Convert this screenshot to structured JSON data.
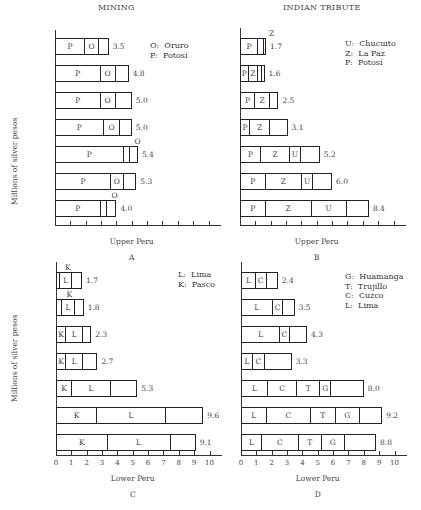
{
  "section_titles": {
    "left": "MINING",
    "right": "INDIAN TRIBUTE"
  },
  "ylabel": "Millions of silver pesos",
  "chart_data": [
    {
      "type": "bar",
      "orientation": "horizontal-stacked",
      "panel": "A",
      "title": "MINING",
      "xlabel": "Upper Peru",
      "ylabel": "Millions of silver pesos",
      "xlim": [
        0,
        10
      ],
      "categories": [
        "1749",
        "'59",
        "'69",
        "'79",
        "'89",
        "'99",
        "1800-09"
      ],
      "legend": [
        {
          "key": "O",
          "name": "Oruro"
        },
        {
          "key": "P",
          "name": "Potosí"
        }
      ],
      "series": [
        {
          "name": "P",
          "values": [
            1.9,
            2.9,
            2.9,
            3.1,
            4.4,
            3.6,
            2.9
          ]
        },
        {
          "name": "O",
          "values": [
            0.9,
            1.0,
            1.0,
            1.1,
            0.4,
            0.8,
            0.4
          ]
        },
        {
          "name": "Other",
          "values": [
            0.7,
            0.9,
            1.1,
            0.8,
            0.6,
            0.9,
            0.7
          ]
        }
      ],
      "totals": [
        3.5,
        4.8,
        5.0,
        5.0,
        5.4,
        5.3,
        4.0
      ]
    },
    {
      "type": "bar",
      "orientation": "horizontal-stacked",
      "panel": "B",
      "title": "INDIAN TRIBUTE",
      "xlabel": "Upper Peru",
      "xlim": [
        0,
        10
      ],
      "categories": [
        "1749",
        "'59",
        "'69",
        "'79",
        "'89",
        "'99",
        "1800-09"
      ],
      "legend": [
        {
          "key": "U",
          "name": "Chucuito"
        },
        {
          "key": "Z",
          "name": "La Paz"
        },
        {
          "key": "P",
          "name": "Potosí"
        }
      ],
      "series": [
        {
          "name": "P",
          "values": [
            1.1,
            0.4,
            0.9,
            0.6,
            1.3,
            1.6,
            1.6
          ]
        },
        {
          "name": "Z",
          "values": [
            0.4,
            0.6,
            1.0,
            1.3,
            1.9,
            2.4,
            3.0
          ]
        },
        {
          "name": "U",
          "values": [
            0.1,
            0.3,
            0.0,
            0.0,
            0.7,
            0.7,
            2.3
          ]
        },
        {
          "name": "Other",
          "values": [
            0.1,
            0.3,
            0.6,
            1.2,
            1.3,
            1.3,
            1.5
          ]
        }
      ],
      "totals": [
        1.7,
        1.6,
        2.5,
        3.1,
        5.2,
        6.0,
        8.4
      ]
    },
    {
      "type": "bar",
      "orientation": "horizontal-stacked",
      "panel": "C",
      "xlabel": "Lower Peru",
      "ylabel": "Millions of silver pesos",
      "xlim": [
        0,
        10
      ],
      "xticks": [
        0,
        1,
        2,
        3,
        4,
        5,
        6,
        7,
        8,
        9,
        10
      ],
      "categories": [
        "1749",
        "'59",
        "'69",
        "'79",
        "'89",
        "'99",
        "1800-09"
      ],
      "legend": [
        {
          "key": "L",
          "name": "Lima"
        },
        {
          "key": "K",
          "name": "Pasco"
        }
      ],
      "series": [
        {
          "name": "K",
          "values": [
            0.1,
            0.3,
            0.6,
            0.6,
            1.0,
            2.6,
            3.3
          ]
        },
        {
          "name": "L",
          "values": [
            0.8,
            0.9,
            1.1,
            1.1,
            2.5,
            4.5,
            4.1
          ]
        },
        {
          "name": "Other",
          "values": [
            0.8,
            0.6,
            0.6,
            1.0,
            1.8,
            2.5,
            1.7
          ]
        }
      ],
      "totals": [
        1.7,
        1.8,
        2.3,
        2.7,
        5.3,
        9.6,
        9.1
      ]
    },
    {
      "type": "bar",
      "orientation": "horizontal-stacked",
      "panel": "D",
      "xlabel": "Lower Peru",
      "xlim": [
        0,
        10
      ],
      "xticks": [
        0,
        1,
        2,
        3,
        4,
        5,
        6,
        7,
        8,
        9,
        10
      ],
      "categories": [
        "1749",
        "'59",
        "'69",
        "'79",
        "'89",
        "'99",
        "1800-09"
      ],
      "legend": [
        {
          "key": "G",
          "name": "Huamanga"
        },
        {
          "key": "T",
          "name": "Trujillo"
        },
        {
          "key": "C",
          "name": "Cuzco"
        },
        {
          "key": "L",
          "name": "Lima"
        }
      ],
      "series": [
        {
          "name": "L",
          "values": [
            0.9,
            2.0,
            2.5,
            0.7,
            1.7,
            1.6,
            1.3
          ]
        },
        {
          "name": "C",
          "values": [
            0.7,
            0.7,
            0.6,
            0.8,
            1.9,
            2.9,
            2.4
          ]
        },
        {
          "name": "T",
          "values": [
            0.0,
            0.0,
            0.0,
            0.0,
            1.5,
            1.6,
            1.5
          ]
        },
        {
          "name": "G",
          "values": [
            0.0,
            0.0,
            0.0,
            0.0,
            0.7,
            1.6,
            1.5
          ]
        },
        {
          "name": "Other",
          "values": [
            0.8,
            0.8,
            1.2,
            1.8,
            2.2,
            1.5,
            2.1
          ]
        }
      ],
      "totals": [
        2.4,
        3.5,
        4.3,
        3.3,
        8.0,
        9.2,
        8.8
      ]
    }
  ],
  "panels": {
    "A": {
      "letter": "A",
      "xlabel": "Upper Peru",
      "legend_text": "O:  Oruro\nP:  Potosí",
      "rows": [
        {
          "label": "1749",
          "total": "3.5",
          "segs": [
            {
              "v": 1.9,
              "t": "P"
            },
            {
              "v": 0.9,
              "t": "O"
            },
            {
              "v": 0.7,
              "t": ""
            }
          ]
        },
        {
          "label": "'59",
          "total": "4.8",
          "segs": [
            {
              "v": 2.9,
              "t": "P"
            },
            {
              "v": 1.0,
              "t": "O"
            },
            {
              "v": 0.9,
              "t": ""
            }
          ]
        },
        {
          "label": "'69",
          "total": "5.0",
          "segs": [
            {
              "v": 2.9,
              "t": "P"
            },
            {
              "v": 1.0,
              "t": "O"
            },
            {
              "v": 1.1,
              "t": ""
            }
          ]
        },
        {
          "label": "'79",
          "total": "5.0",
          "segs": [
            {
              "v": 3.1,
              "t": "P"
            },
            {
              "v": 1.1,
              "t": "O"
            },
            {
              "v": 0.8,
              "t": ""
            }
          ]
        },
        {
          "label": "'89",
          "total": "5.4",
          "segs": [
            {
              "v": 4.4,
              "t": "P"
            },
            {
              "v": 0.4,
              "t": ""
            },
            {
              "v": 0.6,
              "t": ""
            }
          ],
          "callout": "O"
        },
        {
          "label": "'99",
          "total": "5.3",
          "segs": [
            {
              "v": 3.6,
              "t": "P"
            },
            {
              "v": 0.8,
              "t": "O"
            },
            {
              "v": 0.9,
              "t": ""
            }
          ]
        },
        {
          "label": "1800–09",
          "total": "4.0",
          "segs": [
            {
              "v": 2.9,
              "t": "P"
            },
            {
              "v": 0.4,
              "t": ""
            },
            {
              "v": 0.7,
              "t": ""
            }
          ],
          "callout": "O"
        }
      ]
    },
    "B": {
      "letter": "B",
      "xlabel": "Upper Peru",
      "legend_text": "U:  Chucuito\nZ:  La Paz\nP:  Potosí",
      "rows": [
        {
          "label": "",
          "total": "1.7",
          "segs": [
            {
              "v": 1.1,
              "t": "P"
            },
            {
              "v": 0.4,
              "t": ""
            },
            {
              "v": 0.1,
              "t": ""
            },
            {
              "v": 0.1,
              "t": ""
            }
          ],
          "callout": "Z"
        },
        {
          "label": "",
          "total": "1.6",
          "segs": [
            {
              "v": 0.5,
              "t": "P"
            },
            {
              "v": 0.6,
              "t": "Z"
            },
            {
              "v": 0.3,
              "t": ""
            },
            {
              "v": 0.2,
              "t": ""
            }
          ]
        },
        {
          "label": "",
          "total": "2.5",
          "segs": [
            {
              "v": 0.9,
              "t": "P"
            },
            {
              "v": 1.0,
              "t": "Z"
            },
            {
              "v": 0.6,
              "t": ""
            }
          ]
        },
        {
          "label": "",
          "total": "3.1",
          "segs": [
            {
              "v": 0.6,
              "t": "P"
            },
            {
              "v": 1.3,
              "t": "Z"
            },
            {
              "v": 1.2,
              "t": ""
            }
          ]
        },
        {
          "label": "",
          "total": "5.2",
          "segs": [
            {
              "v": 1.3,
              "t": "P"
            },
            {
              "v": 1.9,
              "t": "Z"
            },
            {
              "v": 0.7,
              "t": "U"
            },
            {
              "v": 1.3,
              "t": ""
            }
          ]
        },
        {
          "label": "",
          "total": "6.0",
          "segs": [
            {
              "v": 1.6,
              "t": "P"
            },
            {
              "v": 2.4,
              "t": "Z"
            },
            {
              "v": 0.7,
              "t": "U"
            },
            {
              "v": 1.3,
              "t": ""
            }
          ]
        },
        {
          "label": "",
          "total": "8.4",
          "segs": [
            {
              "v": 1.6,
              "t": "P"
            },
            {
              "v": 3.0,
              "t": "Z"
            },
            {
              "v": 2.3,
              "t": "U"
            },
            {
              "v": 1.5,
              "t": ""
            }
          ]
        }
      ]
    },
    "C": {
      "letter": "C",
      "xlabel": "Lower Peru",
      "legend_text": "L:  Lima\nK:  Pasco",
      "rows": [
        {
          "label": "1749",
          "total": "1.7",
          "segs": [
            {
              "v": 0.2,
              "t": ""
            },
            {
              "v": 0.8,
              "t": "L"
            },
            {
              "v": 0.7,
              "t": ""
            }
          ],
          "callout": "K"
        },
        {
          "label": "'59",
          "total": "1.8",
          "segs": [
            {
              "v": 0.3,
              "t": ""
            },
            {
              "v": 0.9,
              "t": "L"
            },
            {
              "v": 0.6,
              "t": ""
            }
          ],
          "callout": "K"
        },
        {
          "label": "'69",
          "total": "2.3",
          "segs": [
            {
              "v": 0.6,
              "t": "K"
            },
            {
              "v": 1.1,
              "t": "L"
            },
            {
              "v": 0.6,
              "t": ""
            }
          ]
        },
        {
          "label": "'79",
          "total": "2.7",
          "segs": [
            {
              "v": 0.6,
              "t": "K"
            },
            {
              "v": 1.1,
              "t": "L"
            },
            {
              "v": 1.0,
              "t": ""
            }
          ]
        },
        {
          "label": "'89",
          "total": "5.3",
          "segs": [
            {
              "v": 1.0,
              "t": "K"
            },
            {
              "v": 2.5,
              "t": "L"
            },
            {
              "v": 1.8,
              "t": ""
            }
          ]
        },
        {
          "label": "'99",
          "total": "9.6",
          "segs": [
            {
              "v": 2.6,
              "t": "K"
            },
            {
              "v": 4.5,
              "t": "L"
            },
            {
              "v": 2.5,
              "t": ""
            }
          ]
        },
        {
          "label": "1800–09",
          "total": "9.1",
          "segs": [
            {
              "v": 3.3,
              "t": "K"
            },
            {
              "v": 4.1,
              "t": "L"
            },
            {
              "v": 1.7,
              "t": ""
            }
          ]
        }
      ]
    },
    "D": {
      "letter": "D",
      "xlabel": "Lower Peru",
      "legend_text": "G:  Huamanga\nT:  Trujillo\nC:  Cuzco\nL:  Lima",
      "rows": [
        {
          "label": "",
          "total": "2.4",
          "segs": [
            {
              "v": 0.9,
              "t": "L"
            },
            {
              "v": 0.7,
              "t": "C"
            },
            {
              "v": 0.8,
              "t": ""
            }
          ]
        },
        {
          "label": "",
          "total": "3.5",
          "segs": [
            {
              "v": 2.0,
              "t": "L"
            },
            {
              "v": 0.7,
              "t": "C"
            },
            {
              "v": 0.8,
              "t": ""
            }
          ]
        },
        {
          "label": "",
          "total": "4.3",
          "segs": [
            {
              "v": 2.5,
              "t": "L"
            },
            {
              "v": 0.6,
              "t": "C"
            },
            {
              "v": 1.2,
              "t": ""
            }
          ]
        },
        {
          "label": "",
          "total": "3.3",
          "segs": [
            {
              "v": 0.7,
              "t": "L"
            },
            {
              "v": 0.8,
              "t": "C"
            },
            {
              "v": 1.8,
              "t": ""
            }
          ]
        },
        {
          "label": "",
          "total": "8.0",
          "segs": [
            {
              "v": 1.7,
              "t": "L"
            },
            {
              "v": 1.9,
              "t": "C"
            },
            {
              "v": 1.5,
              "t": "T"
            },
            {
              "v": 0.7,
              "t": "G"
            },
            {
              "v": 2.2,
              "t": ""
            }
          ]
        },
        {
          "label": "",
          "total": "9.2",
          "segs": [
            {
              "v": 1.6,
              "t": "L"
            },
            {
              "v": 2.9,
              "t": "C"
            },
            {
              "v": 1.6,
              "t": "T"
            },
            {
              "v": 1.6,
              "t": "G"
            },
            {
              "v": 1.5,
              "t": ""
            }
          ]
        },
        {
          "label": "",
          "total": "8.8",
          "segs": [
            {
              "v": 1.3,
              "t": "L"
            },
            {
              "v": 2.4,
              "t": "C"
            },
            {
              "v": 1.5,
              "t": "T"
            },
            {
              "v": 1.5,
              "t": "G"
            },
            {
              "v": 2.1,
              "t": ""
            }
          ]
        }
      ]
    }
  },
  "xticks": [
    "0",
    "1",
    "2",
    "3",
    "4",
    "5",
    "6",
    "7",
    "8",
    "9",
    "10"
  ]
}
